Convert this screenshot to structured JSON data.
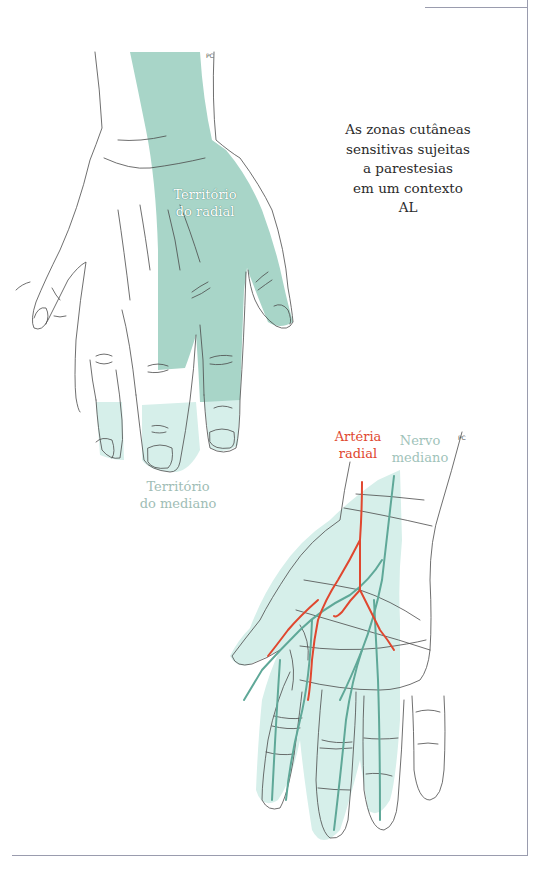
{
  "page": {
    "caption_lines": [
      "As zonas cutâneas",
      "sensitivas sujeitas",
      "a parestesias",
      "em um contexto",
      "AL"
    ]
  },
  "figure_top": {
    "label_radial_line1": "Território",
    "label_radial_line2": "do radial",
    "label_mediano_line1": "Território",
    "label_mediano_line2": "do mediano",
    "signature": "PC"
  },
  "figure_bottom": {
    "label_artery_line1": "Artéria",
    "label_artery_line2": "radial",
    "label_nerve_line1": "Nervo",
    "label_nerve_line2": "mediano",
    "signature": "PC"
  },
  "colors": {
    "radial_territory": "#a8d5c8",
    "median_territory_light": "#d6efea",
    "artery": "#e0472f",
    "nerve": "#5fa898",
    "outline": "#4a4a4a",
    "frame": "#9a9cae"
  }
}
